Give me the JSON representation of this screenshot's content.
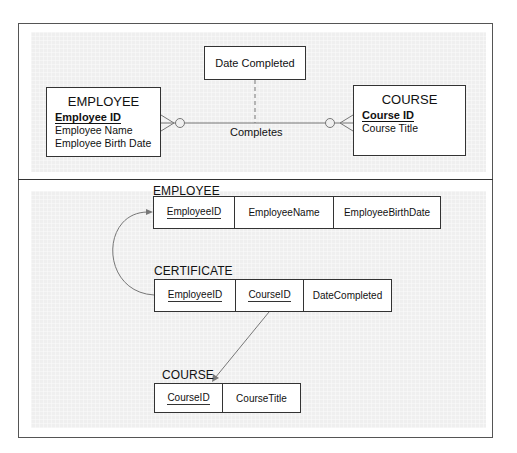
{
  "er_diagram": {
    "relationship_attribute": "Date Completed",
    "relationship_name": "Completes",
    "entities": [
      {
        "name": "EMPLOYEE",
        "primary_key": "Employee ID",
        "attributes": [
          "Employee Name",
          "Employee Birth Date"
        ],
        "cardinality": "many-optional"
      },
      {
        "name": "COURSE",
        "primary_key": "Course ID",
        "attributes": [
          "Course Title"
        ],
        "cardinality": "many-optional"
      }
    ]
  },
  "relational_schema": {
    "tables": [
      {
        "name": "EMPLOYEE",
        "columns": [
          {
            "name": "EmployeeID",
            "primary_key": true
          },
          {
            "name": "EmployeeName",
            "primary_key": false
          },
          {
            "name": "EmployeeBirthDate",
            "primary_key": false
          }
        ]
      },
      {
        "name": "CERTIFICATE",
        "columns": [
          {
            "name": "EmployeeID",
            "primary_key": true
          },
          {
            "name": "CourseID",
            "primary_key": true
          },
          {
            "name": "DateCompleted",
            "primary_key": false
          }
        ]
      },
      {
        "name": "COURSE",
        "columns": [
          {
            "name": "CourseID",
            "primary_key": true
          },
          {
            "name": "CourseTitle",
            "primary_key": false
          }
        ]
      }
    ],
    "foreign_keys": [
      {
        "from": "CERTIFICATE.EmployeeID",
        "to": "EMPLOYEE.EmployeeID"
      },
      {
        "from": "CERTIFICATE.CourseID",
        "to": "COURSE.CourseID"
      }
    ]
  },
  "colors": {
    "panel_background": "#efefef",
    "line": "#333333",
    "connector": "#777777"
  }
}
